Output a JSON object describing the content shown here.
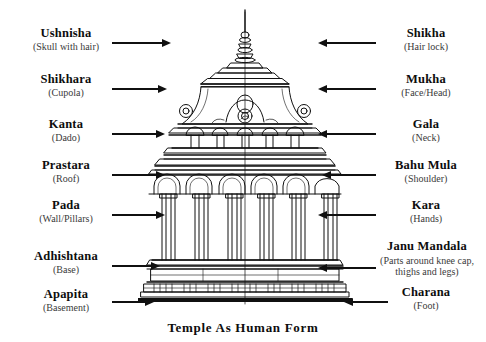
{
  "caption": "Temple As Human Form",
  "colors": {
    "background": "#ffffff",
    "ink": "#101010",
    "gloss_text": "#3a3a3a"
  },
  "left_labels": [
    {
      "term": "Ushnisha",
      "gloss": "(Skull with hair)",
      "arrow": "to-right"
    },
    {
      "term": "Shikhara",
      "gloss": "(Cupola)",
      "arrow": "to-right"
    },
    {
      "term": "Kanta",
      "gloss": "(Dado)",
      "arrow": "to-right"
    },
    {
      "term": "Prastara",
      "gloss": "(Roof)",
      "arrow": "to-right"
    },
    {
      "term": "Pada",
      "gloss": "(Wall/Pillars)",
      "arrow": "to-right"
    },
    {
      "term": "Adhishtana",
      "gloss": "(Base)",
      "arrow": "to-right"
    },
    {
      "term": "Apapita",
      "gloss": "(Basement)",
      "arrow": "to-right"
    }
  ],
  "right_labels": [
    {
      "term": "Shikha",
      "gloss": "(Hair lock)",
      "arrow": "to-left"
    },
    {
      "term": "Mukha",
      "gloss": "(Face/Head)",
      "arrow": "to-left"
    },
    {
      "term": "Gala",
      "gloss": "(Neck)",
      "arrow": "to-left"
    },
    {
      "term": "Bahu Mula",
      "gloss": "(Shoulder)",
      "arrow": "to-left"
    },
    {
      "term": "Kara",
      "gloss": "(Hands)",
      "arrow": "to-left"
    },
    {
      "term": "Janu Mandala",
      "gloss": "(Parts around knee cap, thighs and legs)",
      "arrow": "to-left"
    },
    {
      "term": "Charana",
      "gloss": "(Foot)",
      "arrow": "to-left"
    }
  ],
  "diagram": {
    "name": "south-indian-temple-elevation"
  }
}
